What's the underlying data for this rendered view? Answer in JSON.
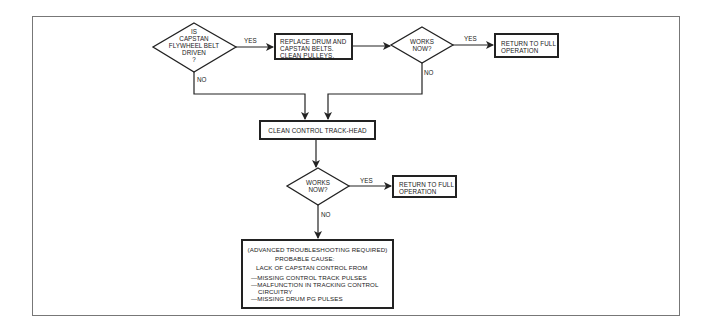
{
  "diagram": {
    "decisions": [
      {
        "id": "d1",
        "lines": [
          "IS",
          "CAPSTAN",
          "FLYWHEEL BELT",
          "DRIVEN",
          "?"
        ]
      },
      {
        "id": "d2",
        "lines": [
          "WORKS",
          "NOW?"
        ]
      },
      {
        "id": "d3",
        "lines": [
          "WORKS",
          "NOW?"
        ]
      }
    ],
    "processes": [
      {
        "id": "p1",
        "lines": [
          "REPLACE DRUM AND",
          "CAPSTAN BELTS.",
          "CLEAN PULLEYS."
        ]
      },
      {
        "id": "p2",
        "lines": [
          "RETURN TO FULL",
          "OPERATION"
        ]
      },
      {
        "id": "p3",
        "lines": [
          "CLEAN CONTROL TRACK-HEAD"
        ]
      },
      {
        "id": "p4",
        "lines": [
          "RETURN TO FULL",
          "OPERATION"
        ]
      },
      {
        "id": "p5",
        "lines": [
          "(ADVANCED TROUBLESHOOTING REQUIRED)",
          "PROBABLE CAUSE:",
          "LACK OF  CAPSTAN CONTROL FROM",
          "—MISSING CONTROL TRACK PULSES",
          "—MALFUNCTION IN TRACKING CONTROL",
          "CIRCUITRY",
          "—MISSING DRUM PG PULSES"
        ]
      }
    ],
    "edge_labels": {
      "d1_yes": "YES",
      "d1_no": "NO",
      "d2_yes": "YES",
      "d2_no": "NO",
      "d3_yes": "YES",
      "d3_no": "NO"
    },
    "colors": {
      "line": "#222222",
      "frame": "#777777",
      "background": "#ffffff"
    }
  }
}
